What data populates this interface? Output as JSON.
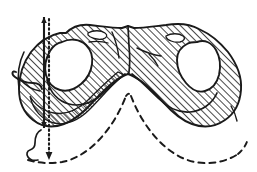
{
  "figure": {
    "style": "vintage line engraving, diagonal hatching",
    "caption": "",
    "background_color": "#ffffff",
    "ink_color": "#1a1a1a",
    "hatch_color": "#1a1a1a",
    "cavity_fill": "#ffffff",
    "width": 257,
    "height": 172
  },
  "elements": {
    "main_mass_label": "hatched bilateral body",
    "left_cavity_label": "left cavity (foramen)",
    "right_cavity_label": "right cavity (foramen)",
    "center_notch_label": "central median notch",
    "left_hook_label": "left lateral hook process",
    "solid_measure_label": "solid vertical measurement line",
    "dotted_measure_label": "dotted vertical axis with arrowhead",
    "dashed_arc_left_label": "left dashed projection arc",
    "dashed_arc_right_label": "right dashed projection arc",
    "lower_outline_label": "lower hook outline",
    "detail_mark_left_label": "left surface detail mark",
    "detail_mark_right_label": "right surface detail mark",
    "center_seam_label": "central median seam"
  },
  "geometry": {
    "outer_outline": "M 68 33 C 76 27, 86 25, 97 27 C 110 29, 124 30, 136 30 C 150 30, 165 28, 178 26 C 190 24, 200 26, 208 31 C 216 36, 223 42, 229 50 C 236 60, 241 72, 241 85 C 241 98, 236 110, 228 118 C 220 126, 209 130, 198 129 C 186 128, 176 122, 168 113 C 160 104, 152 95, 144 88 C 137 82, 132 78, 128 76 C 124 78, 119 82, 112 88 C 104 95, 96 104, 88 113 C 80 122, 70 128, 60 129 C 50 130, 41 126, 36 118 C 30 110, 27 98, 28 85 C 29 72, 34 60, 41 50 C 48 41, 58 36, 68 33 Z",
    "left_cavity": "M 62 43 C 70 39, 79 40, 85 45 C 90 49, 92 55, 91 62 C 90 70, 86 77, 81 82 C 75 88, 68 91, 61 90 C 54 89, 49 84, 47 77 C 45 69, 46 60, 50 53 C 53 47, 57 45, 62 43 Z",
    "right_cavity": "M 196 43 C 204 40, 211 43, 215 49 C 219 56, 220 65, 218 74 C 216 82, 211 88, 205 90 C 198 92, 191 89, 186 83 C 181 77, 178 69, 178 61 C 178 54, 181 48, 187 45 C 190 43, 193 43, 196 43 Z",
    "solid_line_x": 44,
    "dotted_line_x": 49,
    "measure_top_y": 17,
    "measure_bottom_y": 128,
    "dotted_bottom_y": 158
  },
  "annotations": {
    "has_labels": false,
    "visible_text": ""
  }
}
